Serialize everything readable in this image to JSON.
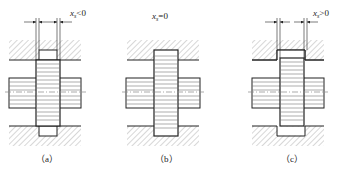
{
  "diagram": {
    "panels": [
      {
        "id": "a",
        "caption": "（a）",
        "label_var": "x",
        "label_sub": "s",
        "label_rel": "<0"
      },
      {
        "id": "b",
        "caption": "（b）",
        "label_var": "x",
        "label_sub": "s",
        "label_rel": "=0"
      },
      {
        "id": "c",
        "caption": "（c）",
        "label_var": "x",
        "label_sub": "s",
        "label_rel": ">0"
      }
    ],
    "colors": {
      "line": "#222222",
      "hatch": "#9a9a9a",
      "center": "#888888"
    }
  }
}
